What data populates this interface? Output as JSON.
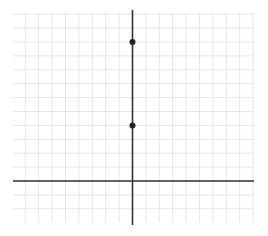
{
  "chart_data": {
    "type": "scatter",
    "title": "",
    "xlabel": "",
    "ylabel": "",
    "grid": true,
    "x_range": [
      -9,
      9
    ],
    "y_range": [
      -3,
      12
    ],
    "points": [
      {
        "x": 0,
        "y": 10
      },
      {
        "x": 0,
        "y": 4
      }
    ]
  },
  "style": {
    "grid_color": "#e6e6e6",
    "axis_color": "#333333",
    "point_color": "#222222",
    "background": "#ffffff"
  },
  "layout": {
    "grid_left": 13,
    "grid_right": 254,
    "grid_top": 13,
    "grid_bottom": 222,
    "origin_x": 132.5,
    "origin_y": 181,
    "unit_x": 13.4,
    "unit_y": 13.9,
    "yaxis_top": 10,
    "yaxis_bottom": 225
  }
}
